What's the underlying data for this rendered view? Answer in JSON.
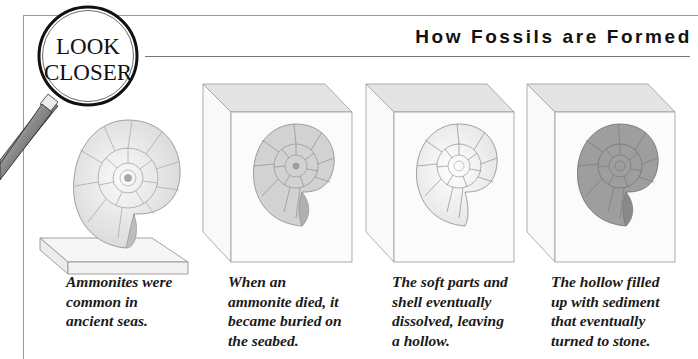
{
  "header": {
    "badge_line1": "LOOK",
    "badge_line2": "CLOSER",
    "title": "How Fossils are Formed"
  },
  "colors": {
    "frame": "#9a9a9a",
    "shell_light": "#e6e6e6",
    "shell_mid": "#cfcfcf",
    "shell_dark": "#9c9c9c",
    "box_top": "#e3e3e3",
    "text": "#1a1a1a"
  },
  "steps": [
    {
      "icon": "ammonite-on-seabed",
      "caption_lines": [
        "Ammonites were",
        "common in",
        "ancient seas."
      ]
    },
    {
      "icon": "ammonite-buried-in-block",
      "caption_lines": [
        "When an",
        "ammonite died, it",
        "became buried on",
        "the seabed."
      ]
    },
    {
      "icon": "ammonite-dissolved-hollow",
      "caption_lines": [
        "The soft parts and",
        "shell eventually",
        "dissolved, leaving",
        "a hollow."
      ]
    },
    {
      "icon": "ammonite-stone-fossil",
      "caption_lines": [
        "The hollow filled",
        "up with sediment",
        "that eventually",
        "turned to stone."
      ]
    }
  ]
}
